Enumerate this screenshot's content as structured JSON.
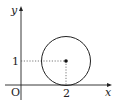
{
  "diagram": {
    "type": "coordinate-plane-circle",
    "axes": {
      "x_label": "x",
      "y_label": "y",
      "origin_label": "O"
    },
    "circle": {
      "center": [
        2,
        1
      ],
      "radius": 1,
      "tangent_to": "x-axis"
    },
    "ticks": {
      "x_tick_label": "2",
      "y_tick_label": "1"
    },
    "guides": "dotted lines from center to axes",
    "colors": {
      "stroke": "#222222",
      "guide": "#555555",
      "background": "#ffffff"
    }
  }
}
